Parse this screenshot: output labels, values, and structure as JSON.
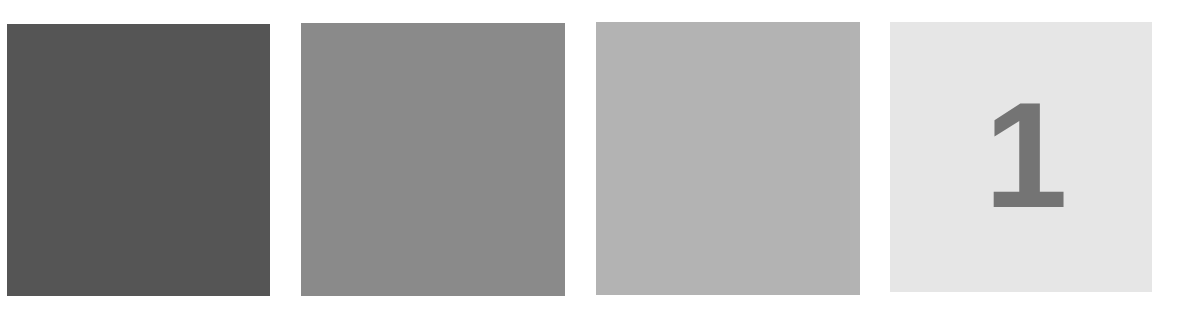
{
  "swatches": [
    {
      "label": "",
      "color": "#555555"
    },
    {
      "label": "",
      "color": "#8a8a8a"
    },
    {
      "label": "",
      "color": "#b3b3b3"
    },
    {
      "label": "1",
      "color": "#e6e6e6",
      "text_color": "#747474"
    }
  ]
}
